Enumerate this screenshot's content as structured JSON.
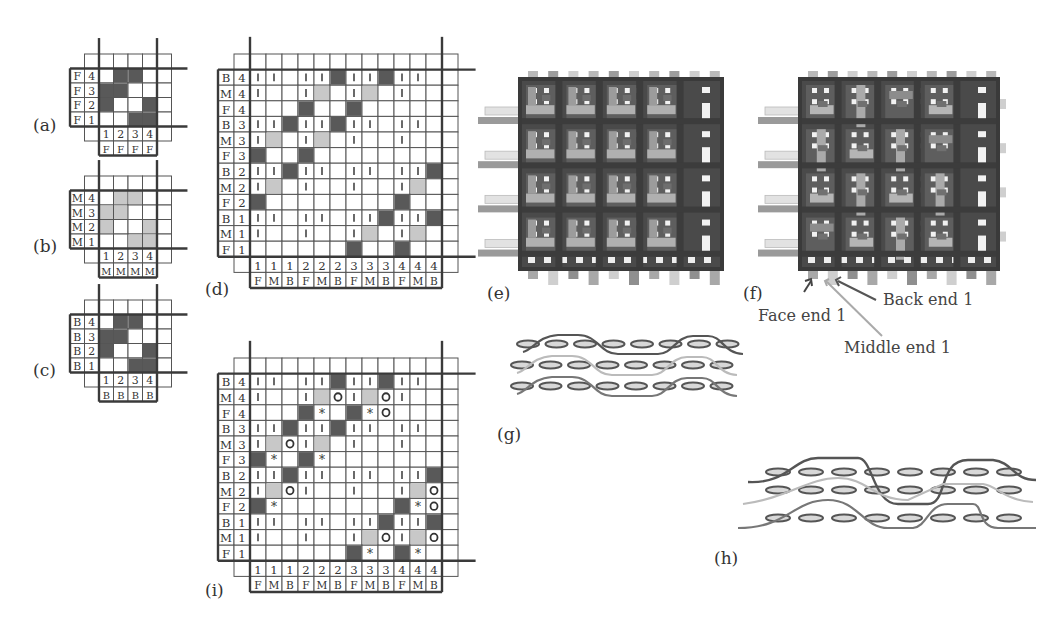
{
  "panels": {
    "a": {
      "label": "(a)"
    },
    "b": {
      "label": "(b)"
    },
    "c": {
      "label": "(c)"
    },
    "d": {
      "label": "(d)"
    },
    "e": {
      "label": "(e)"
    },
    "f": {
      "label": "(f)"
    },
    "g": {
      "label": "(g)"
    },
    "h": {
      "label": "(h)"
    },
    "i": {
      "label": "(i)"
    }
  },
  "callouts": {
    "face_end": "Face end 1",
    "back_end": "Back end 1",
    "middle_end": "Middle end 1"
  },
  "colors": {
    "dark": "#595959",
    "light": "#c8c8c8",
    "grid_line": "#555555",
    "thick_line": "#3a3a3a",
    "cell_bg": "#ffffff"
  },
  "small_grids": [
    {
      "id": "a",
      "layer": "F",
      "x": 70,
      "y": 54,
      "cw": 14.5,
      "ch": 14.5,
      "rows": [
        {
          "letter": "F",
          "num": "4",
          "cells": [
            "_",
            "D",
            "D",
            "_"
          ]
        },
        {
          "letter": "F",
          "num": "3",
          "cells": [
            "D",
            "D",
            "_",
            "_"
          ]
        },
        {
          "letter": "F",
          "num": "2",
          "cells": [
            "D",
            "_",
            "_",
            "D"
          ]
        },
        {
          "letter": "F",
          "num": "1",
          "cells": [
            "_",
            "_",
            "D",
            "D"
          ]
        }
      ],
      "col_nums": [
        "1",
        "2",
        "3",
        "4"
      ],
      "col_letters": [
        "F",
        "F",
        "F",
        "F"
      ]
    },
    {
      "id": "b",
      "layer": "M",
      "x": 70,
      "y": 176,
      "cw": 14.5,
      "ch": 14.5,
      "rows": [
        {
          "letter": "M",
          "num": "4",
          "cells": [
            "_",
            "L",
            "L",
            "_"
          ]
        },
        {
          "letter": "M",
          "num": "3",
          "cells": [
            "L",
            "L",
            "_",
            "_"
          ]
        },
        {
          "letter": "M",
          "num": "2",
          "cells": [
            "L",
            "_",
            "_",
            "L"
          ]
        },
        {
          "letter": "M",
          "num": "1",
          "cells": [
            "_",
            "_",
            "L",
            "L"
          ]
        }
      ],
      "col_nums": [
        "1",
        "2",
        "3",
        "4"
      ],
      "col_letters": [
        "M",
        "M",
        "M",
        "M"
      ]
    },
    {
      "id": "c",
      "layer": "B",
      "x": 70,
      "y": 300,
      "cw": 14.5,
      "ch": 14.5,
      "rows": [
        {
          "letter": "B",
          "num": "4",
          "cells": [
            "_",
            "D",
            "D",
            "_"
          ]
        },
        {
          "letter": "B",
          "num": "3",
          "cells": [
            "D",
            "D",
            "_",
            "_"
          ]
        },
        {
          "letter": "B",
          "num": "2",
          "cells": [
            "D",
            "_",
            "_",
            "D"
          ]
        },
        {
          "letter": "B",
          "num": "1",
          "cells": [
            "_",
            "_",
            "D",
            "D"
          ]
        }
      ],
      "col_nums": [
        "1",
        "2",
        "3",
        "4"
      ],
      "col_letters": [
        "B",
        "B",
        "B",
        "B"
      ]
    }
  ],
  "big_grids": [
    {
      "id": "d",
      "x": 218,
      "y": 54,
      "cw": 16,
      "ch": 15.6,
      "col_nums": [
        "1",
        "1",
        "1",
        "2",
        "2",
        "2",
        "3",
        "3",
        "3",
        "4",
        "4",
        "4"
      ],
      "col_letters": [
        "F",
        "M",
        "B",
        "F",
        "M",
        "B",
        "F",
        "M",
        "B",
        "F",
        "M",
        "B"
      ],
      "rows": [
        {
          "letter": "B",
          "num": "4",
          "cells": [
            "|",
            "|",
            "_",
            "|",
            "|",
            "D",
            "|",
            "|",
            "D",
            "|",
            "|",
            "_"
          ]
        },
        {
          "letter": "M",
          "num": "4",
          "cells": [
            "|",
            "_",
            "_",
            "|",
            "L",
            "_",
            "|",
            "L",
            "_",
            "|",
            "_",
            "_"
          ]
        },
        {
          "letter": "F",
          "num": "4",
          "cells": [
            "_",
            "_",
            "_",
            "D",
            "_",
            "_",
            "D",
            "_",
            "_",
            "_",
            "_",
            "_"
          ]
        },
        {
          "letter": "B",
          "num": "3",
          "cells": [
            "|",
            "|",
            "D",
            "|",
            "|",
            "D",
            "|",
            "|",
            "_",
            "|",
            "|",
            "_"
          ]
        },
        {
          "letter": "M",
          "num": "3",
          "cells": [
            "|",
            "L",
            "_",
            "|",
            "L",
            "_",
            "|",
            "_",
            "_",
            "|",
            "_",
            "_"
          ]
        },
        {
          "letter": "F",
          "num": "3",
          "cells": [
            "D",
            "_",
            "_",
            "D",
            "_",
            "_",
            "_",
            "_",
            "_",
            "_",
            "_",
            "_"
          ]
        },
        {
          "letter": "B",
          "num": "2",
          "cells": [
            "|",
            "|",
            "D",
            "|",
            "|",
            "_",
            "|",
            "|",
            "_",
            "|",
            "|",
            "D"
          ]
        },
        {
          "letter": "M",
          "num": "2",
          "cells": [
            "|",
            "L",
            "_",
            "|",
            "_",
            "_",
            "|",
            "_",
            "_",
            "|",
            "L",
            "_"
          ]
        },
        {
          "letter": "F",
          "num": "2",
          "cells": [
            "D",
            "_",
            "_",
            "_",
            "_",
            "_",
            "_",
            "_",
            "_",
            "D",
            "_",
            "_"
          ]
        },
        {
          "letter": "B",
          "num": "1",
          "cells": [
            "|",
            "|",
            "_",
            "|",
            "|",
            "_",
            "|",
            "|",
            "D",
            "|",
            "|",
            "D"
          ]
        },
        {
          "letter": "M",
          "num": "1",
          "cells": [
            "|",
            "_",
            "_",
            "|",
            "_",
            "_",
            "|",
            "L",
            "_",
            "|",
            "L",
            "_"
          ]
        },
        {
          "letter": "F",
          "num": "1",
          "cells": [
            "_",
            "_",
            "_",
            "_",
            "_",
            "_",
            "D",
            "_",
            "_",
            "D",
            "_",
            "_"
          ]
        }
      ]
    },
    {
      "id": "i",
      "x": 218,
      "y": 358,
      "cw": 16,
      "ch": 15.6,
      "col_nums": [
        "1",
        "1",
        "1",
        "2",
        "2",
        "2",
        "3",
        "3",
        "3",
        "4",
        "4",
        "4"
      ],
      "col_letters": [
        "F",
        "M",
        "B",
        "F",
        "M",
        "B",
        "F",
        "M",
        "B",
        "F",
        "M",
        "B"
      ],
      "rows": [
        {
          "letter": "B",
          "num": "4",
          "cells": [
            "|",
            "|",
            "_",
            "|",
            "|",
            "D",
            "|",
            "|",
            "D",
            "|",
            "|",
            "_"
          ]
        },
        {
          "letter": "M",
          "num": "4",
          "cells": [
            "|",
            "_",
            "_",
            "|",
            "L",
            "O",
            "|",
            "L",
            "O",
            "|",
            "_",
            "_"
          ]
        },
        {
          "letter": "F",
          "num": "4",
          "cells": [
            "_",
            "_",
            "_",
            "D",
            "*",
            "_",
            "D",
            "*",
            "O",
            "_",
            "_",
            "_"
          ]
        },
        {
          "letter": "B",
          "num": "3",
          "cells": [
            "|",
            "|",
            "D",
            "|",
            "|",
            "D",
            "|",
            "|",
            "_",
            "|",
            "|",
            "_"
          ]
        },
        {
          "letter": "M",
          "num": "3",
          "cells": [
            "|",
            "L",
            "O",
            "|",
            "L",
            "_",
            "|",
            "_",
            "_",
            "|",
            "_",
            "_"
          ]
        },
        {
          "letter": "F",
          "num": "3",
          "cells": [
            "D",
            "*",
            "_",
            "D",
            "*",
            "_",
            "_",
            "_",
            "_",
            "_",
            "_",
            "_"
          ]
        },
        {
          "letter": "B",
          "num": "2",
          "cells": [
            "|",
            "|",
            "D",
            "|",
            "|",
            "_",
            "|",
            "|",
            "_",
            "|",
            "|",
            "D"
          ]
        },
        {
          "letter": "M",
          "num": "2",
          "cells": [
            "|",
            "L",
            "O",
            "|",
            "_",
            "_",
            "|",
            "_",
            "_",
            "|",
            "L",
            "O"
          ]
        },
        {
          "letter": "F",
          "num": "2",
          "cells": [
            "D",
            "*",
            "_",
            "_",
            "_",
            "_",
            "_",
            "_",
            "_",
            "D",
            "*",
            "O"
          ]
        },
        {
          "letter": "B",
          "num": "1",
          "cells": [
            "|",
            "|",
            "_",
            "|",
            "|",
            "_",
            "|",
            "|",
            "D",
            "|",
            "|",
            "D"
          ]
        },
        {
          "letter": "M",
          "num": "1",
          "cells": [
            "|",
            "_",
            "_",
            "|",
            "_",
            "_",
            "|",
            "L",
            "O",
            "|",
            "L",
            "O"
          ]
        },
        {
          "letter": "F",
          "num": "1",
          "cells": [
            "_",
            "_",
            "_",
            "_",
            "_",
            "_",
            "D",
            "*",
            "_",
            "D",
            "*",
            "_"
          ]
        }
      ]
    }
  ],
  "legend_symbols": {
    "D": "dark filled cell (warp up)",
    "L": "light filled cell",
    "|": "vertical tick",
    "O": "circle marker",
    "*": "asterisk marker",
    "_": "empty"
  },
  "weave_e": {
    "x": 520,
    "y": 79,
    "w": 202,
    "h": 190
  },
  "weave_f": {
    "x": 800,
    "y": 79,
    "w": 198,
    "h": 190
  },
  "cross_g": {
    "x": 510,
    "y": 330,
    "rows": 3,
    "ellipses_per_row": 8
  },
  "cross_h": {
    "x": 740,
    "y": 460,
    "rows": 3,
    "ellipses_per_row": 8
  }
}
